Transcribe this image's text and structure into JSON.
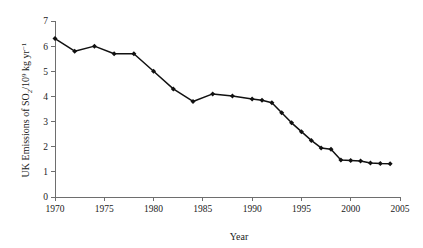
{
  "chart_data": {
    "type": "line",
    "title": "",
    "subtitle": "",
    "xlabel": "Year",
    "ylabel": "UK Emissions of SO2/10^9 kg yr^-1",
    "ylabel_parts": {
      "lead": "UK Emissions of SO",
      "sub_2": "2",
      "mid": "/10",
      "sup_9": "9",
      "tail": " kg yr",
      "sup_minus1": "−1"
    },
    "xlim": [
      1970,
      2005
    ],
    "ylim": [
      0,
      7
    ],
    "xticks": [
      1970,
      1975,
      1980,
      1985,
      1990,
      1995,
      2000,
      2005
    ],
    "xtick_labels": [
      "1970",
      "1975",
      "1980",
      "1985",
      "1990",
      "1995",
      "2000",
      "2005"
    ],
    "yticks": [
      0,
      1,
      2,
      3,
      4,
      5,
      6,
      7
    ],
    "ytick_labels": [
      "0",
      "1",
      "2",
      "3",
      "4",
      "5",
      "6",
      "7"
    ],
    "grid": false,
    "legend": false,
    "legend_position": "none",
    "marker": "filled-diamond",
    "line_color": "#111111",
    "marker_color": "#111111",
    "axis_color": "#6e6e6e",
    "background_color": "#ffffff",
    "x": [
      1970,
      1972,
      1974,
      1976,
      1978,
      1980,
      1982,
      1984,
      1986,
      1988,
      1990,
      1991,
      1992,
      1993,
      1994,
      1995,
      1996,
      1997,
      1998,
      1999,
      2000,
      2001,
      2002,
      2003,
      2004
    ],
    "values": [
      6.3,
      5.8,
      6.0,
      5.7,
      5.7,
      5.0,
      4.3,
      3.8,
      4.1,
      4.02,
      3.9,
      3.85,
      3.75,
      3.35,
      2.95,
      2.6,
      2.25,
      1.95,
      1.9,
      1.47,
      1.45,
      1.43,
      1.35,
      1.33,
      1.32
    ],
    "series": [
      {
        "name": "UK SO2 emissions",
        "x": [
          1970,
          1972,
          1974,
          1976,
          1978,
          1980,
          1982,
          1984,
          1986,
          1988,
          1990,
          1991,
          1992,
          1993,
          1994,
          1995,
          1996,
          1997,
          1998,
          1999,
          2000,
          2001,
          2002,
          2003,
          2004
        ],
        "values": [
          6.3,
          5.8,
          6.0,
          5.7,
          5.7,
          5.0,
          4.3,
          3.8,
          4.1,
          4.02,
          3.9,
          3.85,
          3.75,
          3.35,
          2.95,
          2.6,
          2.25,
          1.95,
          1.9,
          1.47,
          1.45,
          1.43,
          1.35,
          1.33,
          1.32
        ]
      }
    ]
  }
}
